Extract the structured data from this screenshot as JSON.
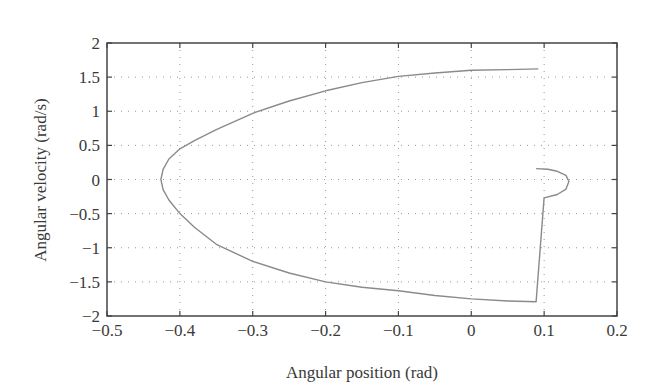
{
  "chart_data": {
    "type": "line",
    "title": "",
    "xlabel": "Angular position (rad)",
    "ylabel": "Angular velocity (rad/s)",
    "xlim": [
      -0.5,
      0.2
    ],
    "ylim": [
      -2,
      2
    ],
    "grid": true,
    "grid_style": "dotted",
    "legend": null,
    "xticks": [
      -0.5,
      -0.4,
      -0.3,
      -0.2,
      -0.1,
      0,
      0.1,
      0.2
    ],
    "xtick_labels": [
      "−0.5",
      "−0.4",
      "−0.3",
      "−0.2",
      "−0.1",
      "0",
      "0.1",
      "0.2"
    ],
    "yticks": [
      2,
      1.5,
      1,
      0.5,
      0,
      -0.5,
      -1,
      -1.5,
      -2
    ],
    "ytick_labels": [
      "2",
      "1.5",
      "1",
      "0.5",
      "0",
      "−0.5",
      "−1",
      "−1.5",
      "−2"
    ],
    "line_color": "#8a8a8a",
    "series": [
      {
        "name": "phase trajectory",
        "x": [
          0.092,
          0.05,
          0.0,
          -0.05,
          -0.1,
          -0.15,
          -0.2,
          -0.25,
          -0.3,
          -0.35,
          -0.38,
          -0.4,
          -0.415,
          -0.423,
          -0.426,
          -0.423,
          -0.415,
          -0.4,
          -0.38,
          -0.35,
          -0.3,
          -0.25,
          -0.2,
          -0.15,
          -0.1,
          -0.05,
          0.0,
          0.05,
          0.089,
          0.1,
          0.118,
          0.13,
          0.134,
          0.13,
          0.118,
          0.105,
          0.089
        ],
        "y": [
          1.62,
          1.61,
          1.6,
          1.56,
          1.51,
          1.42,
          1.3,
          1.15,
          0.97,
          0.73,
          0.57,
          0.45,
          0.3,
          0.15,
          0.0,
          -0.15,
          -0.3,
          -0.5,
          -0.7,
          -0.95,
          -1.2,
          -1.37,
          -1.5,
          -1.58,
          -1.63,
          -1.7,
          -1.75,
          -1.78,
          -1.79,
          -0.27,
          -0.22,
          -0.14,
          -0.03,
          0.06,
          0.12,
          0.15,
          0.16
        ]
      }
    ]
  }
}
